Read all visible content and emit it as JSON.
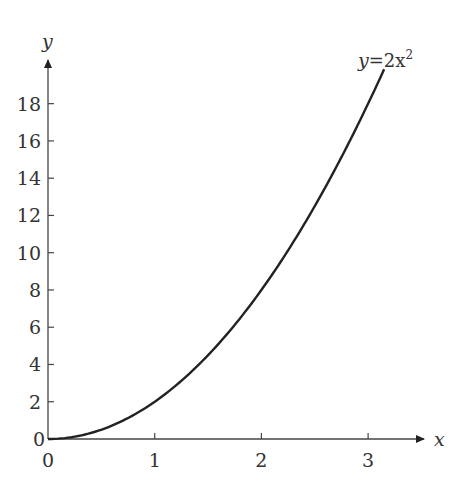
{
  "chart_data": {
    "type": "line",
    "title": "",
    "xlabel": "x",
    "ylabel": "y",
    "xlim": [
      0,
      3.4
    ],
    "ylim": [
      0,
      20
    ],
    "grid": false,
    "x_ticks": [
      0,
      1,
      2,
      3
    ],
    "y_ticks": [
      0,
      2,
      4,
      6,
      8,
      10,
      12,
      14,
      16,
      18
    ],
    "series": [
      {
        "name": "y=2x^2",
        "function": "y = 2x^2",
        "x": [
          0,
          0.5,
          1,
          1.5,
          2,
          2.5,
          3,
          3.15
        ],
        "values": [
          0,
          0.5,
          2,
          4.5,
          8,
          12.5,
          18,
          19.8
        ]
      }
    ],
    "annotations": [
      {
        "text": "y=2x²",
        "x": 3.15,
        "y": 19.8
      }
    ]
  },
  "labels": {
    "x_axis": "x",
    "y_axis": "y",
    "curve_y": "y",
    "curve_eq": "=2x",
    "curve_exp": "2",
    "origin_y": "0",
    "x_ticks": [
      "0",
      "1",
      "2",
      "3"
    ],
    "y_ticks": [
      "2",
      "4",
      "6",
      "8",
      "10",
      "12",
      "14",
      "16",
      "18"
    ]
  },
  "colors": {
    "axis": "#444444",
    "curve": "#222222",
    "text": "#333333"
  }
}
